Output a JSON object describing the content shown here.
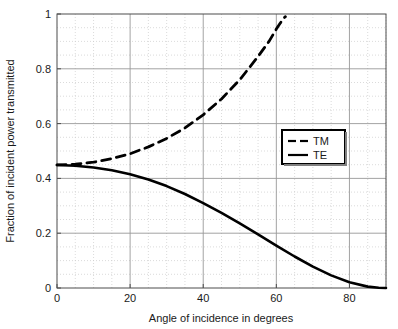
{
  "chart_data": {
    "type": "line",
    "title": "",
    "xlabel": "Angle of incidence in degrees",
    "ylabel": "Fraction of incident power transmitted",
    "xlim": [
      0,
      90
    ],
    "ylim": [
      0,
      1
    ],
    "xticks": [
      0,
      20,
      40,
      60,
      80
    ],
    "xtick_labels": [
      "0",
      "20",
      "40",
      "60",
      "80"
    ],
    "yticks": [
      0,
      0.2,
      0.4,
      0.6,
      0.8,
      1
    ],
    "ytick_labels": [
      "0",
      "0.2",
      "0.4",
      "0.6",
      "0.8",
      "1"
    ],
    "minor_x_step": 5,
    "minor_y_step": 0.05,
    "grid": true,
    "grid_major_color": "#999999",
    "grid_minor_color": "#cccccc",
    "legend_position": "center-right",
    "series": [
      {
        "name": "TM",
        "style": "dashed",
        "color": "#000000",
        "x": [
          0,
          5,
          10,
          15,
          20,
          25,
          30,
          35,
          40,
          45,
          50,
          55,
          58,
          60,
          61,
          62,
          62.5
        ],
        "values": [
          0.449,
          0.452,
          0.459,
          0.472,
          0.49,
          0.515,
          0.546,
          0.584,
          0.632,
          0.69,
          0.76,
          0.845,
          0.9,
          0.945,
          0.965,
          0.985,
          0.99
        ]
      },
      {
        "name": "TE",
        "style": "solid",
        "color": "#000000",
        "x": [
          0,
          5,
          10,
          15,
          20,
          25,
          30,
          35,
          40,
          45,
          50,
          55,
          60,
          65,
          70,
          75,
          80,
          85,
          88,
          90
        ],
        "values": [
          0.449,
          0.446,
          0.44,
          0.43,
          0.415,
          0.396,
          0.372,
          0.343,
          0.31,
          0.274,
          0.236,
          0.196,
          0.155,
          0.115,
          0.078,
          0.046,
          0.021,
          0.005,
          0.001,
          0.0
        ]
      }
    ]
  },
  "legend": {
    "items": [
      {
        "label": "TM",
        "style": "dashed"
      },
      {
        "label": "TE",
        "style": "solid"
      }
    ]
  }
}
